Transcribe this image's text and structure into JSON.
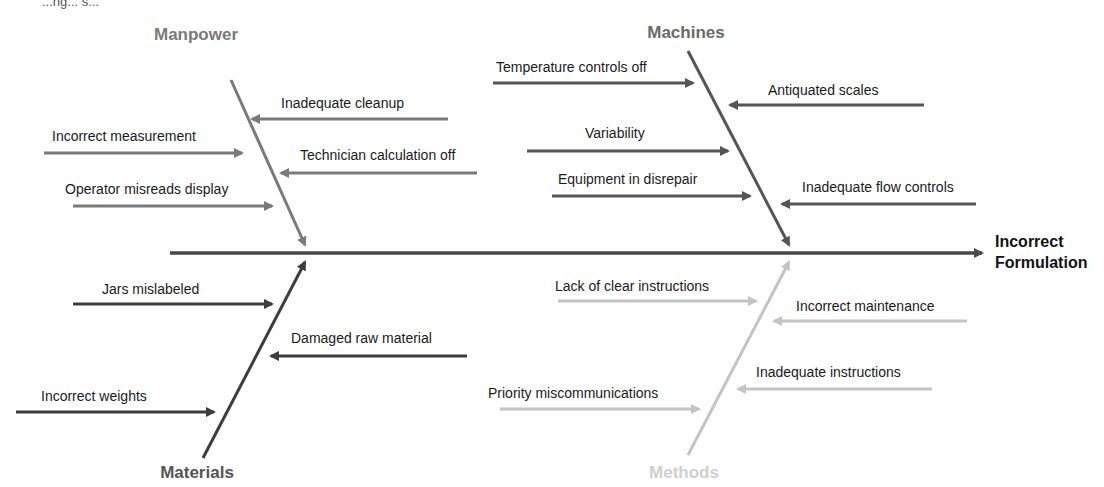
{
  "caption": "...ng... s...",
  "colors": {
    "spine": "#4a4a4a",
    "manpower": "#7a7a7a",
    "machines": "#555555",
    "materials": "#3d3d3d",
    "methods": "#c4c4c4",
    "text": "#1a1a1a"
  },
  "effect": {
    "line1": "Incorrect",
    "line2": "Formulation"
  },
  "categories": {
    "manpower": {
      "label": "Manpower",
      "causes": [
        "Inadequate cleanup",
        "Incorrect measurement",
        "Technician calculation off",
        "Operator misreads display"
      ]
    },
    "machines": {
      "label": "Machines",
      "causes": [
        "Temperature controls off",
        "Antiquated scales",
        "Variability",
        "Equipment in disrepair",
        "Inadequate flow controls"
      ]
    },
    "materials": {
      "label": "Materials",
      "causes": [
        "Jars mislabeled",
        "Damaged raw material",
        "Incorrect weights"
      ]
    },
    "methods": {
      "label": "Methods",
      "causes": [
        "Lack of clear instructions",
        "Incorrect maintenance",
        "Inadequate instructions",
        "Priority miscommunications"
      ]
    }
  }
}
